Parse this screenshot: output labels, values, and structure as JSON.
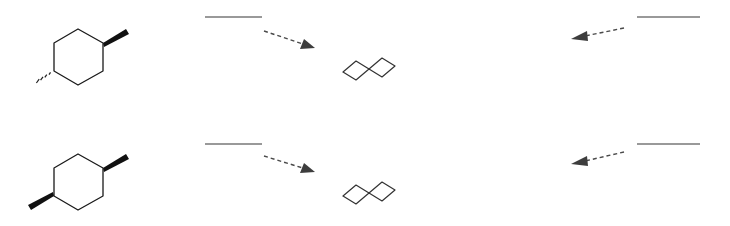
{
  "canvas": {
    "width": 730,
    "height": 226,
    "background": "#ffffff"
  },
  "style": {
    "bond_color": "#1a1a1a",
    "bond_width": 1.3,
    "wedge_color": "#111111",
    "hash_color": "#222222",
    "chair_color": "#333333",
    "chair_width": 1.2,
    "blank_line_color": "#999999",
    "blank_line_width": 2,
    "arrow_color": "#4a4a4a",
    "arrow_width": 1.4,
    "arrow_dash": "4 3",
    "arrow_head_color": "#3d3d3d"
  },
  "rows": [
    {
      "name": "row-trans",
      "structure": {
        "name": "trans-1,4-dimethylcyclohexane",
        "ring_points": "78,29 103,43 103,71 78,85 54,71 54,43",
        "wedge": {
          "name": "methyl-wedge-up",
          "points": "103,43 126,29 129,34 104,47"
        },
        "hash": {
          "name": "methyl-hash-down",
          "strokes": [
            {
              "x1": 53.0,
              "y1": 70.5,
              "x2": 53.0,
              "y2": 70.5
            },
            {
              "x1": 50.5,
              "y1": 72.3,
              "x2": 49.0,
              "y2": 74.6
            },
            {
              "x1": 46.8,
              "y1": 74.6,
              "x2": 44.8,
              "y2": 77.4
            },
            {
              "x1": 43.0,
              "y1": 76.9,
              "x2": 40.6,
              "y2": 80.2
            },
            {
              "x1": 39.2,
              "y1": 79.2,
              "x2": 36.4,
              "y2": 83.0
            }
          ]
        }
      },
      "chair": {
        "name": "chair-conformation",
        "points": "343,72 356,61 369,69 382,58 395,66 382,77 369,69 356,80 343,72",
        "outline": "343,72 356,61 369,69 382,58 395,66 382,77 369,69 356,80"
      },
      "left_blank_label": {
        "name": "blank-label-left",
        "x1": 205,
        "y1": 17,
        "x2": 262,
        "y2": 17
      },
      "left_arrow": {
        "name": "dashed-arrow-right",
        "x1": 264,
        "y1": 31,
        "x2": 306,
        "y2": 45,
        "head": "315,48 300,49 304,39"
      },
      "right_blank_label": {
        "name": "blank-label-right",
        "x1": 637,
        "y1": 17,
        "x2": 700,
        "y2": 17
      },
      "right_arrow": {
        "name": "dashed-arrow-left",
        "x1": 624,
        "y1": 28,
        "x2": 585,
        "y2": 36,
        "head": "571,39 587,31 588,41"
      }
    },
    {
      "name": "row-cis",
      "structure": {
        "name": "cis-1,4-dimethylcyclohexane",
        "ring_points": "78,154 103,168 103,196 78,210 54,196 54,168",
        "wedge": {
          "name": "methyl-wedge-up-right",
          "points": "103,168 126,154 129,159 104,172"
        },
        "wedge2": {
          "name": "methyl-wedge-up-left",
          "points": "54,196 31,210 28,205 53,192"
        }
      },
      "chair": {
        "name": "chair-conformation",
        "points": "343,196 356,185 369,193 382,182 395,190 382,201 369,193 356,204 343,196",
        "outline": "343,196 356,185 369,193 382,182 395,190 382,201 369,193 356,204"
      },
      "left_blank_label": {
        "name": "blank-label-left",
        "x1": 205,
        "y1": 144,
        "x2": 262,
        "y2": 144
      },
      "left_arrow": {
        "name": "dashed-arrow-right",
        "x1": 264,
        "y1": 156,
        "x2": 306,
        "y2": 169,
        "head": "315,172 300,173 304,163"
      },
      "right_blank_label": {
        "name": "blank-label-right",
        "x1": 637,
        "y1": 144,
        "x2": 700,
        "y2": 144
      },
      "right_arrow": {
        "name": "dashed-arrow-left",
        "x1": 624,
        "y1": 152,
        "x2": 585,
        "y2": 161,
        "head": "571,164 587,156 588,166"
      }
    }
  ]
}
